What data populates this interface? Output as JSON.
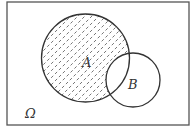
{
  "diagram": {
    "type": "venn",
    "universe_label": "Ω",
    "sets": [
      {
        "name": "A",
        "label": "A",
        "shaded": true
      },
      {
        "name": "B",
        "label": "B",
        "shaded": false
      }
    ],
    "shaded_region": "A minus B",
    "colors": {
      "stroke": "#333333",
      "hatch": "#555555",
      "background": "#ffffff"
    }
  }
}
